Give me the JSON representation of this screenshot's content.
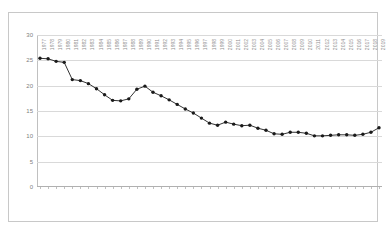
{
  "chart_data": {
    "type": "line",
    "title": "",
    "subtitle": "",
    "xlabel": "",
    "ylabel": "",
    "ylim": [
      0,
      30
    ],
    "yticks": [
      0,
      5,
      10,
      15,
      20,
      25,
      30
    ],
    "grid": true,
    "legend": false,
    "legend_position": "none",
    "marker": "circle",
    "line_color": "#333333",
    "marker_color": "#1a1a1a",
    "categories": [
      "1977",
      "1978",
      "1979",
      "1980",
      "1981",
      "1982",
      "1983",
      "1984",
      "1985",
      "1986",
      "1987",
      "1988",
      "1989",
      "1990",
      "1991",
      "1992",
      "1993",
      "1994",
      "1995",
      "1996",
      "1997",
      "1998",
      "1999",
      "2000",
      "2001",
      "2002",
      "2003",
      "2004",
      "2005",
      "2006",
      "2007",
      "2008",
      "2009",
      "2010",
      "2011",
      "2012",
      "2013",
      "2014",
      "2015",
      "2016",
      "2017",
      "2018",
      "2019"
    ],
    "values": [
      25.4,
      25.3,
      24.8,
      24.6,
      21.2,
      21.0,
      20.4,
      19.4,
      18.2,
      17.1,
      17.0,
      17.4,
      19.3,
      19.9,
      18.7,
      18.0,
      17.2,
      16.3,
      15.4,
      14.6,
      13.6,
      12.6,
      12.2,
      12.8,
      12.4,
      12.1,
      12.2,
      11.6,
      11.2,
      10.5,
      10.4,
      10.8,
      10.8,
      10.6,
      10.1,
      10.1,
      10.2,
      10.3,
      10.3,
      10.2,
      10.4,
      10.8,
      11.7
    ]
  },
  "axes": {
    "y_axis_name": "y-axis",
    "x_axis_name": "x-axis"
  }
}
